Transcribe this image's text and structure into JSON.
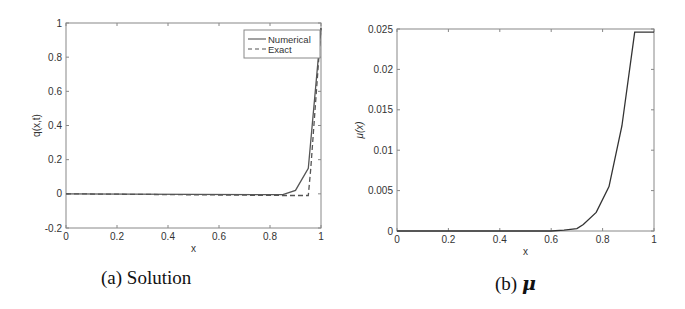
{
  "chart_data": [
    {
      "type": "line",
      "title": "",
      "caption": "(a) Solution",
      "xlabel": "x",
      "ylabel": "q(x,t)",
      "xlim": [
        0,
        1
      ],
      "ylim": [
        -0.2,
        1
      ],
      "xticks": [
        "0",
        "0.2",
        "0.4",
        "0.6",
        "0.8",
        "1"
      ],
      "yticks": [
        "-0.2",
        "0",
        "0.2",
        "0.4",
        "0.6",
        "0.8",
        "1"
      ],
      "grid": false,
      "legend_position": "upper right",
      "series": [
        {
          "name": "Numerical",
          "style": "solid",
          "x": [
            0,
            0.85,
            0.9,
            0.95,
            1.0
          ],
          "y": [
            0,
            -0.005,
            0.02,
            0.15,
            0.97
          ]
        },
        {
          "name": "Exact",
          "style": "dashed",
          "x": [
            0,
            0.85,
            0.95,
            0.96,
            1.0
          ],
          "y": [
            0,
            -0.01,
            -0.01,
            0.15,
            0.97
          ]
        }
      ]
    },
    {
      "type": "line",
      "title": "",
      "caption_prefix": "(b)",
      "caption_symbol": "μ",
      "xlabel": "x",
      "ylabel": "μ(x)",
      "xlim": [
        0,
        1
      ],
      "ylim": [
        0,
        0.025
      ],
      "xticks": [
        "0",
        "0.2",
        "0.4",
        "0.6",
        "0.8",
        "1"
      ],
      "yticks": [
        "0",
        "0.005",
        "0.01",
        "0.015",
        "0.02",
        "0.025"
      ],
      "grid": false,
      "series": [
        {
          "name": "mu",
          "style": "solid",
          "x": [
            0,
            0.6,
            0.65,
            0.7,
            0.725,
            0.775,
            0.825,
            0.875,
            0.925,
            1.0
          ],
          "y": [
            0,
            0,
            0.0001,
            0.0003,
            0.0008,
            0.0023,
            0.0055,
            0.013,
            0.0246,
            0.0246
          ]
        }
      ]
    }
  ]
}
